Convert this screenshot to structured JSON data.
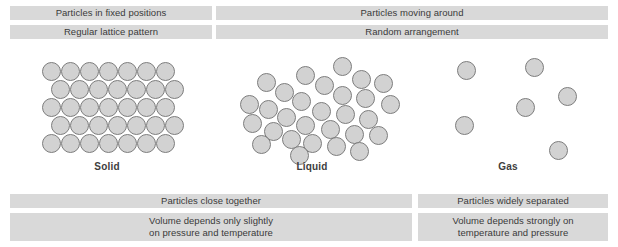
{
  "figure": {
    "colors": {
      "bar_background": "#d9d9d9",
      "bar_text": "#3a3a3a",
      "particle_fill": "#d2d2d2",
      "particle_stroke": "#7d7d7d",
      "label_text": "#3d3d3d",
      "page_background": "#ffffff"
    }
  },
  "top_bars": [
    {
      "id": "solid-fixed-positions",
      "lines": [
        "Particles in fixed positions"
      ],
      "x": 10,
      "y": 6,
      "w": 202,
      "h": 14
    },
    {
      "id": "fluid-moving-around",
      "lines": [
        "Particles moving around"
      ],
      "x": 216,
      "y": 6,
      "w": 392,
      "h": 14
    },
    {
      "id": "solid-regular-lattice",
      "lines": [
        "Regular lattice pattern"
      ],
      "x": 10,
      "y": 25,
      "w": 202,
      "h": 14
    },
    {
      "id": "fluid-random-arrangement",
      "lines": [
        "Random arrangement"
      ],
      "x": 216,
      "y": 25,
      "w": 392,
      "h": 14
    }
  ],
  "bottom_bars": [
    {
      "id": "condensed-close-together",
      "lines": [
        "Particles close together"
      ],
      "x": 10,
      "y": 194,
      "w": 402,
      "h": 14
    },
    {
      "id": "gas-widely-separated",
      "lines": [
        "Particles widely separated"
      ],
      "x": 418,
      "y": 194,
      "w": 190,
      "h": 14
    },
    {
      "id": "condensed-volume-behaviour",
      "lines": [
        "Volume depends only slightly",
        "on pressure and temperature"
      ],
      "x": 10,
      "y": 213,
      "w": 402,
      "h": 28
    },
    {
      "id": "gas-volume-behaviour",
      "lines": [
        "Volume depends strongly on",
        "temperature and pressure"
      ],
      "x": 418,
      "y": 213,
      "w": 190,
      "h": 28
    }
  ],
  "state_labels": [
    {
      "id": "solid",
      "text": "Solid",
      "x": 107,
      "y": 161
    },
    {
      "id": "liquid",
      "text": "Liquid",
      "x": 312,
      "y": 161
    },
    {
      "id": "gas",
      "text": "Gas",
      "x": 508,
      "y": 161
    }
  ],
  "panels": {
    "solid": {
      "label": "Solid",
      "arrangement": "close-packed regular lattice",
      "rows": 5,
      "particles_per_row": [
        7,
        7,
        7,
        7,
        7
      ],
      "particle_count": 35,
      "particle_diameter": 19,
      "particles": [
        {
          "x": 42,
          "y": 62
        },
        {
          "x": 61,
          "y": 62
        },
        {
          "x": 80,
          "y": 62
        },
        {
          "x": 99,
          "y": 62
        },
        {
          "x": 118,
          "y": 62
        },
        {
          "x": 137,
          "y": 62
        },
        {
          "x": 156,
          "y": 62
        },
        {
          "x": 51,
          "y": 80
        },
        {
          "x": 70,
          "y": 80
        },
        {
          "x": 89,
          "y": 80
        },
        {
          "x": 108,
          "y": 80
        },
        {
          "x": 127,
          "y": 80
        },
        {
          "x": 146,
          "y": 80
        },
        {
          "x": 165,
          "y": 80
        },
        {
          "x": 42,
          "y": 98
        },
        {
          "x": 61,
          "y": 98
        },
        {
          "x": 80,
          "y": 98
        },
        {
          "x": 99,
          "y": 98
        },
        {
          "x": 118,
          "y": 98
        },
        {
          "x": 137,
          "y": 98
        },
        {
          "x": 156,
          "y": 98
        },
        {
          "x": 51,
          "y": 116
        },
        {
          "x": 70,
          "y": 116
        },
        {
          "x": 89,
          "y": 116
        },
        {
          "x": 108,
          "y": 116
        },
        {
          "x": 127,
          "y": 116
        },
        {
          "x": 146,
          "y": 116
        },
        {
          "x": 165,
          "y": 116
        },
        {
          "x": 42,
          "y": 134
        },
        {
          "x": 61,
          "y": 134
        },
        {
          "x": 80,
          "y": 134
        },
        {
          "x": 99,
          "y": 134
        },
        {
          "x": 118,
          "y": 134
        },
        {
          "x": 137,
          "y": 134
        },
        {
          "x": 156,
          "y": 134
        }
      ]
    },
    "liquid": {
      "label": "Liquid",
      "arrangement": "close together but randomly arranged",
      "particle_count": 29,
      "particle_diameter": 19,
      "particles": [
        {
          "x": 333,
          "y": 57
        },
        {
          "x": 296,
          "y": 66
        },
        {
          "x": 352,
          "y": 70
        },
        {
          "x": 257,
          "y": 73
        },
        {
          "x": 315,
          "y": 76
        },
        {
          "x": 374,
          "y": 74
        },
        {
          "x": 275,
          "y": 83
        },
        {
          "x": 333,
          "y": 86
        },
        {
          "x": 240,
          "y": 95
        },
        {
          "x": 292,
          "y": 92
        },
        {
          "x": 356,
          "y": 89
        },
        {
          "x": 381,
          "y": 95
        },
        {
          "x": 259,
          "y": 100
        },
        {
          "x": 312,
          "y": 102
        },
        {
          "x": 336,
          "y": 105
        },
        {
          "x": 277,
          "y": 108
        },
        {
          "x": 359,
          "y": 110
        },
        {
          "x": 243,
          "y": 114
        },
        {
          "x": 296,
          "y": 116
        },
        {
          "x": 321,
          "y": 120
        },
        {
          "x": 264,
          "y": 122
        },
        {
          "x": 345,
          "y": 125
        },
        {
          "x": 369,
          "y": 126
        },
        {
          "x": 282,
          "y": 130
        },
        {
          "x": 303,
          "y": 134
        },
        {
          "x": 252,
          "y": 135
        },
        {
          "x": 327,
          "y": 137
        },
        {
          "x": 350,
          "y": 142
        },
        {
          "x": 290,
          "y": 146
        }
      ]
    },
    "gas": {
      "label": "Gas",
      "arrangement": "widely separated, moving freely",
      "particle_count": 6,
      "particle_diameter": 19,
      "particles": [
        {
          "x": 457,
          "y": 61
        },
        {
          "x": 525,
          "y": 58
        },
        {
          "x": 558,
          "y": 87
        },
        {
          "x": 516,
          "y": 98
        },
        {
          "x": 455,
          "y": 116
        },
        {
          "x": 549,
          "y": 141
        }
      ]
    }
  }
}
